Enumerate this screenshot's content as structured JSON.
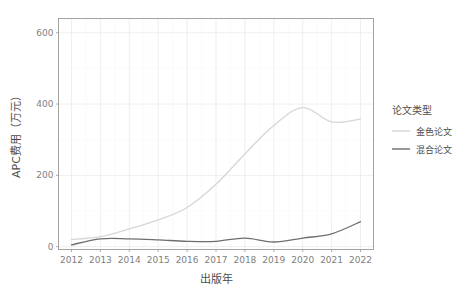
{
  "chart_data": {
    "type": "line",
    "title": "",
    "xlabel": "出版年",
    "ylabel": "APC费用（万元）",
    "x": [
      2012,
      2013,
      2014,
      2015,
      2016,
      2017,
      2018,
      2019,
      2020,
      2021,
      2022
    ],
    "categories": [
      "2012",
      "2013",
      "2014",
      "2015",
      "2016",
      "2017",
      "2018",
      "2019",
      "2020",
      "2021",
      "2022"
    ],
    "series": [
      {
        "name": "金色论文",
        "color": "#d6d6d6",
        "values": [
          20,
          28,
          50,
          75,
          110,
          175,
          260,
          340,
          390,
          350,
          358
        ]
      },
      {
        "name": "混合论文",
        "color": "#6e6e6e",
        "values": [
          5,
          22,
          22,
          19,
          15,
          15,
          24,
          13,
          24,
          36,
          70
        ]
      }
    ],
    "xlim": [
      2011.55,
      2022.45
    ],
    "ylim": [
      -8,
      640
    ],
    "yticks": [
      0,
      200,
      400,
      600
    ],
    "ytick_labels": [
      "0",
      "200",
      "400",
      "600"
    ],
    "xticks": [
      2012,
      2013,
      2014,
      2015,
      2016,
      2017,
      2018,
      2019,
      2020,
      2021,
      2022
    ],
    "grid": true,
    "legend_position": "right",
    "legend": {
      "title": "论文类型",
      "entries": [
        {
          "label": "金色论文",
          "color": "#d6d6d6"
        },
        {
          "label": "混合论文",
          "color": "#6e6e6e"
        }
      ]
    }
  },
  "colors": {
    "gold_series": "#d6d6d6",
    "hybrid_series": "#6e6e6e",
    "panel_border": "#9a9a9a",
    "grid_major": "#ebebeb",
    "axis_text": "#808080",
    "title_text": "#4d4d4d",
    "background": "#ffffff"
  }
}
